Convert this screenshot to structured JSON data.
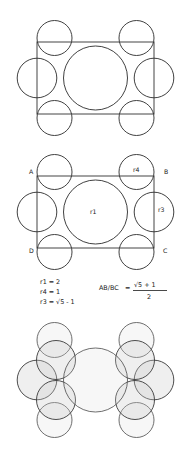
{
  "document": {
    "title": "Golden ratio circle packing construction",
    "background_color": "#ffffff",
    "stroke_color": "#2b2b2b",
    "shade_fill_color": "#c9c9c9"
  },
  "figure1": {
    "name": "circle-packing-unlabeled",
    "rectangle": {
      "x": 37,
      "y": 28,
      "width": 117,
      "height": 72
    },
    "circles": [
      {
        "id": "center",
        "cx": 95.5,
        "cy": 64,
        "r": 32
      },
      {
        "id": "left-mid",
        "cx": 37,
        "cy": 64,
        "r": 19.8
      },
      {
        "id": "right-mid",
        "cx": 154,
        "cy": 64,
        "r": 19.8
      },
      {
        "id": "top-left",
        "cx": 54.5,
        "cy": 24,
        "r": 17.5
      },
      {
        "id": "top-right",
        "cx": 136.5,
        "cy": 24,
        "r": 17.5
      },
      {
        "id": "bottom-left",
        "cx": 54.5,
        "cy": 104,
        "r": 17.5
      },
      {
        "id": "bottom-right",
        "cx": 136.5,
        "cy": 104,
        "r": 17.5
      }
    ]
  },
  "figure2": {
    "name": "circle-packing-labeled",
    "rectangle": {
      "x": 37,
      "y": 24,
      "width": 117,
      "height": 72
    },
    "circles": [
      {
        "id": "center",
        "cx": 95.5,
        "cy": 60,
        "r": 32
      },
      {
        "id": "left-mid",
        "cx": 37,
        "cy": 60,
        "r": 19.8
      },
      {
        "id": "right-mid",
        "cx": 154,
        "cy": 60,
        "r": 19.8
      },
      {
        "id": "top-left",
        "cx": 54.5,
        "cy": 20,
        "r": 17.5
      },
      {
        "id": "top-right",
        "cx": 136.5,
        "cy": 20,
        "r": 17.5
      },
      {
        "id": "bottom-left",
        "cx": 54.5,
        "cy": 100,
        "r": 17.5
      },
      {
        "id": "bottom-right",
        "cx": 136.5,
        "cy": 100,
        "r": 17.5
      }
    ],
    "labels": [
      {
        "id": "vertex-a",
        "text": "A",
        "x": 29,
        "y": 22
      },
      {
        "id": "vertex-b",
        "text": "B",
        "x": 164,
        "y": 22
      },
      {
        "id": "vertex-c",
        "text": "C",
        "x": 163,
        "y": 101
      },
      {
        "id": "vertex-d",
        "text": "D",
        "x": 29,
        "y": 101
      },
      {
        "id": "radius-r1",
        "text": "r1",
        "x": 90,
        "y": 62
      },
      {
        "id": "radius-r3",
        "text": "r3",
        "x": 158,
        "y": 60
      },
      {
        "id": "radius-r4",
        "text": "r4",
        "x": 133,
        "y": 20
      }
    ]
  },
  "equations": {
    "name": "radius-equations",
    "left_block": [
      {
        "id": "eq-r1",
        "text": "r1 = 2"
      },
      {
        "id": "eq-r4",
        "text": "r4 = 1"
      },
      {
        "id": "eq-r3",
        "text": "r3 = √5 - 1"
      }
    ],
    "ratio": {
      "id": "eq-ratio",
      "lhs": "AB/BC",
      "equals": "=",
      "numerator": "√5 + 1",
      "denominator": "2"
    }
  },
  "figure3": {
    "name": "circle-packing-shaded",
    "circles": [
      {
        "id": "center",
        "cx": 95.5,
        "cy": 68,
        "r": 32
      },
      {
        "id": "left-mid",
        "cx": 37,
        "cy": 68,
        "r": 19.8
      },
      {
        "id": "right-mid",
        "cx": 154,
        "cy": 68,
        "r": 19.8
      },
      {
        "id": "top-left-outer",
        "cx": 54.5,
        "cy": 28,
        "r": 17.5
      },
      {
        "id": "top-right-outer",
        "cx": 136.5,
        "cy": 28,
        "r": 17.5
      },
      {
        "id": "bottom-left-outer",
        "cx": 54.5,
        "cy": 108,
        "r": 17.5
      },
      {
        "id": "bottom-right-outer",
        "cx": 136.5,
        "cy": 108,
        "r": 17.5
      },
      {
        "id": "top-left-inner",
        "cx": 56,
        "cy": 48,
        "r": 19.5
      },
      {
        "id": "top-right-inner",
        "cx": 135,
        "cy": 48,
        "r": 19.5
      },
      {
        "id": "bottom-left-inner",
        "cx": 56,
        "cy": 88,
        "r": 19.5
      },
      {
        "id": "bottom-right-inner",
        "cx": 135,
        "cy": 88,
        "r": 19.5
      }
    ]
  }
}
